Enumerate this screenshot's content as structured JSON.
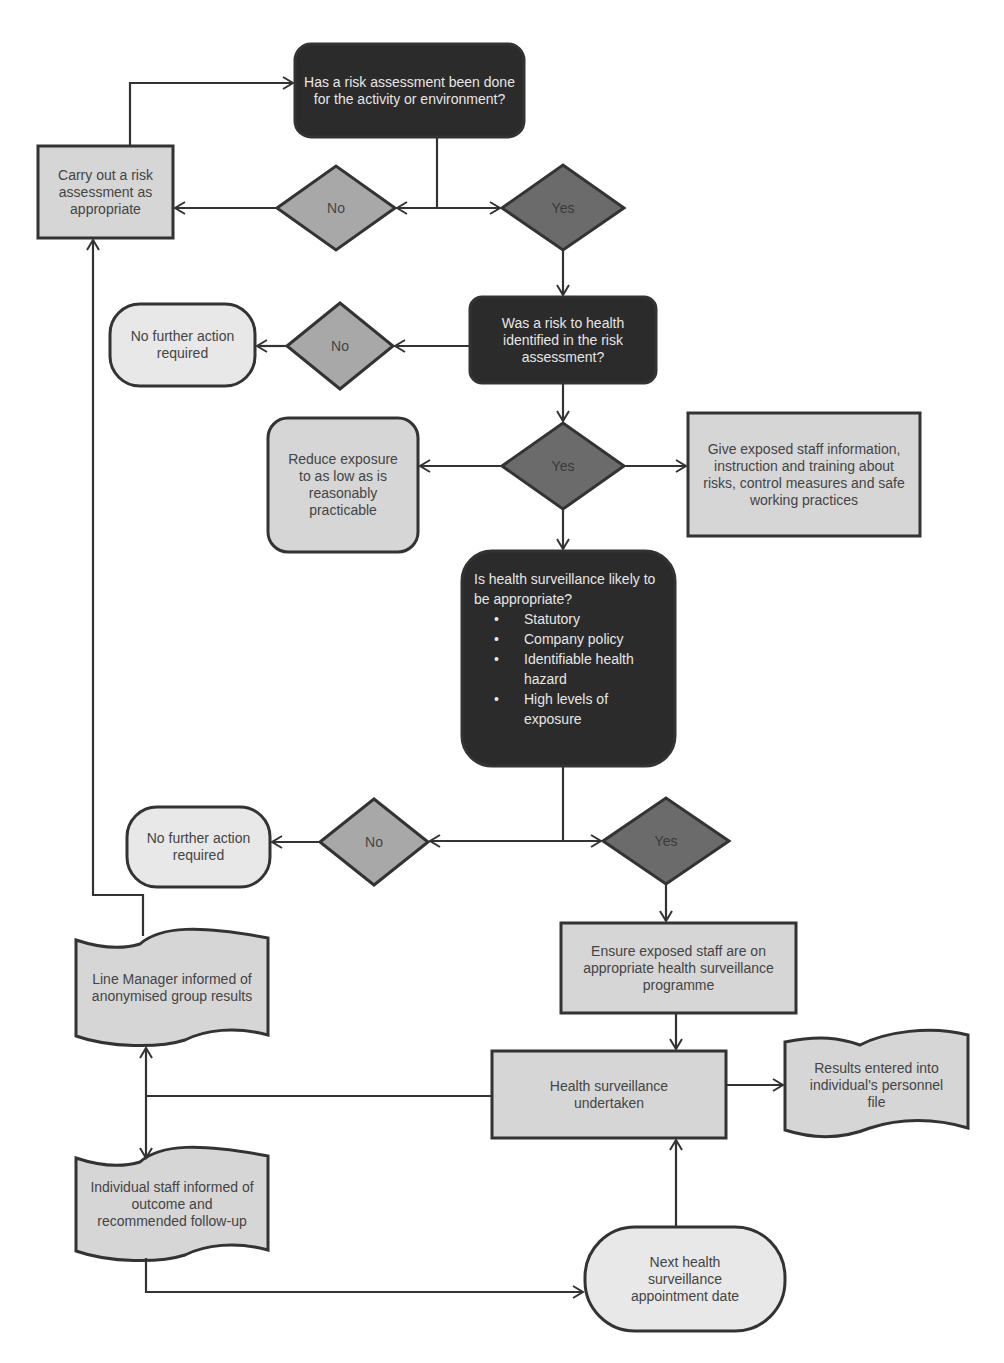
{
  "diagram": {
    "type": "flowchart",
    "colors": {
      "dark_box": "#2b2b2b",
      "light_box": "#d6d6d6",
      "pale_box": "#e8e8e8",
      "diamond_no": "#a8a8a8",
      "diamond_yes": "#6b6b6b",
      "stroke": "#333333"
    },
    "nodes": {
      "q_risk_assessment": "Has a risk assessment been done for the activity or environment?",
      "carry_out": "Carry out a risk assessment as appropriate",
      "d1_no": "No",
      "d1_yes": "Yes",
      "q_risk_health": "Was a risk to health identified in the risk assessment?",
      "d2_no": "No",
      "nfa1": "No further action required",
      "d3_yes": "Yes",
      "reduce": "Reduce exposure to as low as is reasonably practicable",
      "give_info": "Give exposed staff information, instruction and training about risks, control measures and safe working practices",
      "q_surveillance": {
        "title": "Is health surveillance likely to be appropriate?",
        "criteria": [
          "Statutory",
          "Company policy",
          "Identifiable health hazard",
          "High levels of exposure"
        ]
      },
      "d4_no": "No",
      "d4_yes": "Yes",
      "nfa2": "No further action required",
      "ensure": "Ensure exposed staff are on appropriate health surveillance programme",
      "undertaken": "Health surveillance undertaken",
      "results_file": "Results entered into individual's personnel file",
      "line_manager": "Line Manager informed of anonymised group results",
      "individual": "Individual staff informed of outcome and recommended follow-up",
      "next_appt": "Next health surveillance appointment date"
    }
  }
}
